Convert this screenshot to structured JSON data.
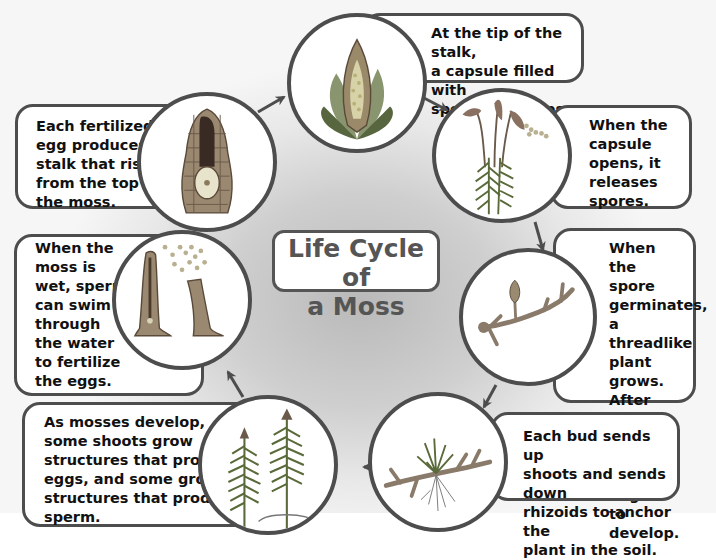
{
  "title": {
    "line1": "Life Cycle of",
    "line2": "a Moss"
  },
  "stages": [
    {
      "id": "capsule-forms",
      "illustration": "capsule-with-spores",
      "text": "At the tip of the stalk,\na capsule filled with\nspores develops."
    },
    {
      "id": "spores-released",
      "illustration": "capsules-releasing-spores",
      "text": "When the\ncapsule\nopens, it\nreleases\nspores."
    },
    {
      "id": "spore-germinates",
      "illustration": "threadlike-protonema",
      "text": "When\nthe spore\ngerminates,\na threadlike\nplant grows.\nAfter about\nthree days,\nbuds begin\nto develop."
    },
    {
      "id": "bud-shoots",
      "illustration": "bud-with-rhizoids",
      "text": "Each bud sends up\nshoots and sends down\nrhizoids to anchor the\nplant in the soil."
    },
    {
      "id": "mosses-develop",
      "illustration": "mature-moss-shoots",
      "text": "As mosses develop,\nsome shoots grow\nstructures that produce\neggs, and some grow\nstructures that produce\nsperm."
    },
    {
      "id": "fertilization",
      "illustration": "sperm-swimming-to-egg",
      "text": "When the\nmoss is\nwet, sperm\ncan swim\nthrough\nthe water\nto fertilize\nthe eggs."
    },
    {
      "id": "stalk-rises",
      "illustration": "fertilized-egg-in-archegonium",
      "text": "Each fertilized\negg produces a\nstalk that rises\nfrom the top of\nthe moss."
    }
  ],
  "colors": {
    "outline": "#4d4d4d",
    "title_text": "#555555",
    "plant_green": "#6b7a4a",
    "background_gray": "#c8c8c8"
  }
}
